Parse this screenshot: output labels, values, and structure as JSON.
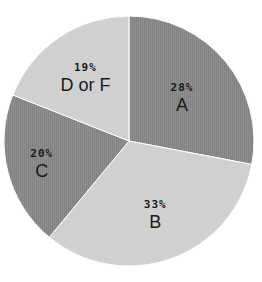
{
  "chart_data": {
    "type": "pie",
    "title": "",
    "start": "top",
    "direction": "clockwise",
    "slices": [
      {
        "label": "A",
        "value": 28,
        "value_label": "28%",
        "color": "#8c8c8c"
      },
      {
        "label": "B",
        "value": 33,
        "value_label": "33%",
        "color": "#d0d0d0"
      },
      {
        "label": "C",
        "value": 20,
        "value_label": "20%",
        "color": "#8c8c8c"
      },
      {
        "label": "D or F",
        "value": 19,
        "value_label": "19%",
        "color": "#d0d0d0"
      }
    ],
    "legend": "none",
    "units": "percent"
  }
}
